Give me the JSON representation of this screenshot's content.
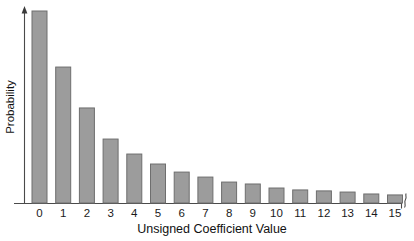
{
  "chart_data": {
    "type": "bar",
    "title": "",
    "subtitle": "",
    "xlabel": "Unsigned Coefficient Value",
    "ylabel": "Probability",
    "categories": [
      "0",
      "1",
      "2",
      "3",
      "4",
      "5",
      "6",
      "7",
      "8",
      "9",
      "10",
      "11",
      "12",
      "13",
      "14",
      "15"
    ],
    "values": [
      1.0,
      0.708,
      0.495,
      0.333,
      0.255,
      0.203,
      0.161,
      0.135,
      0.109,
      0.099,
      0.078,
      0.068,
      0.063,
      0.057,
      0.047,
      0.042
    ],
    "series": [
      {
        "name": "Probability",
        "values": [
          1.0,
          0.708,
          0.495,
          0.333,
          0.255,
          0.203,
          0.161,
          0.135,
          0.109,
          0.099,
          0.078,
          0.068,
          0.063,
          0.057,
          0.047,
          0.042
        ]
      }
    ],
    "xlim": [
      -0.5,
      15.5
    ],
    "ylim": [
      0,
      1.0
    ],
    "grid": false,
    "legend": false,
    "legend_position": "none",
    "y_tick_labels": [],
    "x_tick_labels": [
      "0",
      "1",
      "2",
      "3",
      "4",
      "5",
      "6",
      "7",
      "8",
      "9",
      "10",
      "11",
      "12",
      "13",
      "14",
      "15"
    ],
    "annotations": [
      {
        "name": "x-axis-break",
        "text": "",
        "description": "zigzag axis break mark at right end of x-axis indicating truncated range"
      }
    ],
    "colors": {
      "bar_fill": "#9c9c9c",
      "bar_stroke": "#6e6e6e",
      "axis": "#4a4a4a",
      "text": "#111111",
      "background": "#ffffff"
    },
    "axis_style": {
      "y_axis_arrow": true,
      "x_axis_arrow": false,
      "x_axis_break": true
    }
  }
}
